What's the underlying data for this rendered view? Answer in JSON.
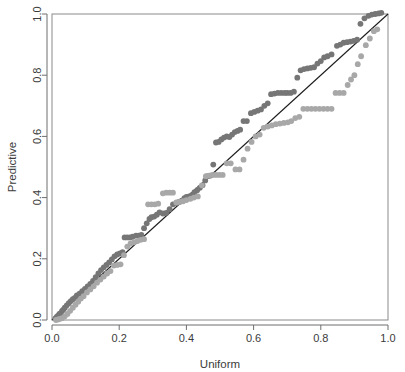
{
  "figure": {
    "background_color": "#ffffff",
    "width": 405,
    "height": 372
  },
  "chart_data": {
    "type": "scatter",
    "title": "",
    "xlabel": "Uniform",
    "ylabel": "Predictive",
    "xlim": [
      0.0,
      1.0
    ],
    "ylim": [
      0.0,
      1.0
    ],
    "grid": false,
    "legend": "none",
    "xticks": [
      0.0,
      0.2,
      0.4,
      0.6,
      0.8,
      1.0
    ],
    "yticks": [
      0.0,
      0.2,
      0.4,
      0.6,
      0.8,
      1.0
    ],
    "xtick_labels": [
      "0.0",
      "0.2",
      "0.4",
      "0.6",
      "0.8",
      "1.0"
    ],
    "ytick_labels": [
      "0.0",
      "0.2",
      "0.4",
      "0.6",
      "0.8",
      "1.0"
    ],
    "reference_line": {
      "name": "identity-line",
      "type": "line",
      "from": [
        0.0,
        0.0
      ],
      "to": [
        1.0,
        1.0
      ],
      "color": "#1c1c1c",
      "width": 1.1
    },
    "marker": {
      "shape": "circle",
      "radius_px": 2.9
    },
    "series": [
      {
        "name": "dark-series",
        "color": "#767676",
        "points": [
          [
            0.01,
            0.005
          ],
          [
            0.014,
            0.01
          ],
          [
            0.018,
            0.014
          ],
          [
            0.022,
            0.02
          ],
          [
            0.026,
            0.022
          ],
          [
            0.03,
            0.03
          ],
          [
            0.034,
            0.034
          ],
          [
            0.038,
            0.04
          ],
          [
            0.044,
            0.048
          ],
          [
            0.05,
            0.055
          ],
          [
            0.056,
            0.062
          ],
          [
            0.062,
            0.068
          ],
          [
            0.068,
            0.072
          ],
          [
            0.074,
            0.08
          ],
          [
            0.082,
            0.086
          ],
          [
            0.09,
            0.094
          ],
          [
            0.098,
            0.102
          ],
          [
            0.106,
            0.11
          ],
          [
            0.114,
            0.118
          ],
          [
            0.122,
            0.128
          ],
          [
            0.13,
            0.14
          ],
          [
            0.138,
            0.152
          ],
          [
            0.146,
            0.163
          ],
          [
            0.154,
            0.172
          ],
          [
            0.162,
            0.18
          ],
          [
            0.17,
            0.188
          ],
          [
            0.178,
            0.198
          ],
          [
            0.186,
            0.208
          ],
          [
            0.194,
            0.214
          ],
          [
            0.202,
            0.218
          ],
          [
            0.21,
            0.222
          ],
          [
            0.216,
            0.27
          ],
          [
            0.224,
            0.27
          ],
          [
            0.232,
            0.27
          ],
          [
            0.24,
            0.272
          ],
          [
            0.25,
            0.276
          ],
          [
            0.258,
            0.276
          ],
          [
            0.266,
            0.278
          ],
          [
            0.274,
            0.3
          ],
          [
            0.282,
            0.316
          ],
          [
            0.29,
            0.33
          ],
          [
            0.296,
            0.336
          ],
          [
            0.304,
            0.338
          ],
          [
            0.312,
            0.344
          ],
          [
            0.32,
            0.352
          ],
          [
            0.33,
            0.348
          ],
          [
            0.34,
            0.35
          ],
          [
            0.35,
            0.362
          ],
          [
            0.36,
            0.378
          ],
          [
            0.37,
            0.382
          ],
          [
            0.378,
            0.386
          ],
          [
            0.386,
            0.39
          ],
          [
            0.394,
            0.398
          ],
          [
            0.4,
            0.402
          ],
          [
            0.408,
            0.404
          ],
          [
            0.416,
            0.408
          ],
          [
            0.424,
            0.418
          ],
          [
            0.432,
            0.424
          ],
          [
            0.44,
            0.432
          ],
          [
            0.448,
            0.44
          ],
          [
            0.456,
            0.456
          ],
          [
            0.464,
            0.47
          ],
          [
            0.472,
            0.472
          ],
          [
            0.48,
            0.508
          ],
          [
            0.488,
            0.58
          ],
          [
            0.496,
            0.582
          ],
          [
            0.504,
            0.59
          ],
          [
            0.512,
            0.596
          ],
          [
            0.52,
            0.6
          ],
          [
            0.528,
            0.598
          ],
          [
            0.536,
            0.606
          ],
          [
            0.544,
            0.614
          ],
          [
            0.552,
            0.618
          ],
          [
            0.56,
            0.622
          ],
          [
            0.57,
            0.65
          ],
          [
            0.58,
            0.65
          ],
          [
            0.592,
            0.676
          ],
          [
            0.602,
            0.68
          ],
          [
            0.612,
            0.684
          ],
          [
            0.622,
            0.688
          ],
          [
            0.632,
            0.7
          ],
          [
            0.642,
            0.708
          ],
          [
            0.652,
            0.738
          ],
          [
            0.662,
            0.74
          ],
          [
            0.672,
            0.742
          ],
          [
            0.682,
            0.742
          ],
          [
            0.692,
            0.742
          ],
          [
            0.7,
            0.742
          ],
          [
            0.71,
            0.742
          ],
          [
            0.72,
            0.746
          ],
          [
            0.73,
            0.792
          ],
          [
            0.74,
            0.816
          ],
          [
            0.75,
            0.82
          ],
          [
            0.76,
            0.822
          ],
          [
            0.77,
            0.824
          ],
          [
            0.78,
            0.826
          ],
          [
            0.79,
            0.838
          ],
          [
            0.8,
            0.846
          ],
          [
            0.81,
            0.858
          ],
          [
            0.82,
            0.862
          ],
          [
            0.832,
            0.868
          ],
          [
            0.848,
            0.896
          ],
          [
            0.858,
            0.9
          ],
          [
            0.868,
            0.906
          ],
          [
            0.878,
            0.908
          ],
          [
            0.888,
            0.91
          ],
          [
            0.898,
            0.912
          ],
          [
            0.908,
            0.916
          ],
          [
            0.918,
            0.968
          ],
          [
            0.93,
            0.986
          ],
          [
            0.942,
            0.994
          ],
          [
            0.952,
            0.998
          ],
          [
            0.962,
            1.0
          ],
          [
            0.972,
            1.002
          ],
          [
            0.98,
            1.004
          ]
        ]
      },
      {
        "name": "light-series",
        "color": "#a8a8a8",
        "points": [
          [
            0.012,
            0.0
          ],
          [
            0.018,
            0.002
          ],
          [
            0.024,
            0.004
          ],
          [
            0.03,
            0.006
          ],
          [
            0.038,
            0.012
          ],
          [
            0.046,
            0.02
          ],
          [
            0.054,
            0.03
          ],
          [
            0.062,
            0.04
          ],
          [
            0.07,
            0.05
          ],
          [
            0.078,
            0.06
          ],
          [
            0.086,
            0.07
          ],
          [
            0.094,
            0.078
          ],
          [
            0.104,
            0.09
          ],
          [
            0.114,
            0.1
          ],
          [
            0.124,
            0.11
          ],
          [
            0.134,
            0.122
          ],
          [
            0.144,
            0.132
          ],
          [
            0.154,
            0.142
          ],
          [
            0.164,
            0.152
          ],
          [
            0.174,
            0.16
          ],
          [
            0.184,
            0.178
          ],
          [
            0.194,
            0.18
          ],
          [
            0.204,
            0.182
          ],
          [
            0.214,
            0.212
          ],
          [
            0.224,
            0.24
          ],
          [
            0.234,
            0.25
          ],
          [
            0.244,
            0.254
          ],
          [
            0.254,
            0.258
          ],
          [
            0.264,
            0.262
          ],
          [
            0.274,
            0.264
          ],
          [
            0.286,
            0.378
          ],
          [
            0.296,
            0.378
          ],
          [
            0.306,
            0.378
          ],
          [
            0.316,
            0.38
          ],
          [
            0.33,
            0.414
          ],
          [
            0.34,
            0.416
          ],
          [
            0.35,
            0.416
          ],
          [
            0.36,
            0.416
          ],
          [
            0.37,
            0.384
          ],
          [
            0.38,
            0.386
          ],
          [
            0.39,
            0.388
          ],
          [
            0.4,
            0.392
          ],
          [
            0.412,
            0.396
          ],
          [
            0.422,
            0.4
          ],
          [
            0.434,
            0.404
          ],
          [
            0.446,
            0.44
          ],
          [
            0.458,
            0.47
          ],
          [
            0.468,
            0.472
          ],
          [
            0.478,
            0.474
          ],
          [
            0.488,
            0.474
          ],
          [
            0.498,
            0.474
          ],
          [
            0.508,
            0.474
          ],
          [
            0.52,
            0.512
          ],
          [
            0.532,
            0.512
          ],
          [
            0.546,
            0.492
          ],
          [
            0.558,
            0.492
          ],
          [
            0.57,
            0.524
          ],
          [
            0.582,
            0.56
          ],
          [
            0.594,
            0.582
          ],
          [
            0.606,
            0.6
          ],
          [
            0.618,
            0.606
          ],
          [
            0.63,
            0.628
          ],
          [
            0.642,
            0.632
          ],
          [
            0.654,
            0.636
          ],
          [
            0.666,
            0.64
          ],
          [
            0.678,
            0.642
          ],
          [
            0.69,
            0.644
          ],
          [
            0.702,
            0.646
          ],
          [
            0.712,
            0.65
          ],
          [
            0.724,
            0.66
          ],
          [
            0.736,
            0.664
          ],
          [
            0.748,
            0.69
          ],
          [
            0.76,
            0.69
          ],
          [
            0.772,
            0.69
          ],
          [
            0.784,
            0.69
          ],
          [
            0.796,
            0.69
          ],
          [
            0.808,
            0.69
          ],
          [
            0.82,
            0.69
          ],
          [
            0.832,
            0.69
          ],
          [
            0.844,
            0.742
          ],
          [
            0.856,
            0.742
          ],
          [
            0.868,
            0.742
          ],
          [
            0.88,
            0.768
          ],
          [
            0.89,
            0.786
          ],
          [
            0.9,
            0.8
          ],
          [
            0.91,
            0.836
          ],
          [
            0.92,
            0.862
          ],
          [
            0.934,
            0.898
          ],
          [
            0.946,
            0.92
          ],
          [
            0.958,
            0.944
          ],
          [
            0.968,
            0.95
          ]
        ]
      }
    ]
  }
}
